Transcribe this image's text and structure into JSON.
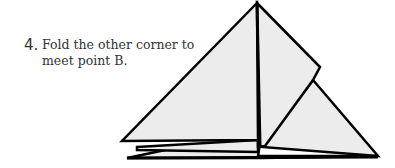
{
  "instruction": {
    "step_number": "4.",
    "line1": "Fold the other corner to",
    "line2": "meet point B."
  },
  "diagram": {
    "fill_color": "#ececec",
    "stroke_color": "#000000"
  }
}
